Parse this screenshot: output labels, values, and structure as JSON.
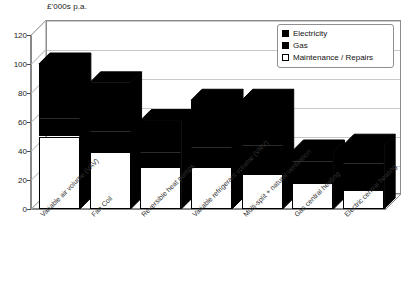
{
  "chart_data": {
    "type": "bar",
    "subtype": "stacked-3d-column",
    "title": "",
    "ylabel": "£'000s p.a.",
    "xlabel": "",
    "ylim": [
      0,
      120
    ],
    "yticks": [
      0,
      20,
      40,
      60,
      80,
      100,
      120
    ],
    "grid": true,
    "legend_position": "top-right",
    "categories": [
      "Variable air volume (VAV)",
      "Fan Coil",
      "Reversible heat pumps",
      "Variable refrigerant volume (VRV)",
      "Multi-split + natural ventilation",
      "Gas central heating",
      "Electric central heating"
    ],
    "series": [
      {
        "name": "Maintenance / Repairs",
        "color": "#ffffff",
        "values": [
          50,
          39,
          29,
          29,
          24,
          18,
          13
        ]
      },
      {
        "name": "Gas",
        "color": "#000000",
        "values": [
          13,
          15,
          10,
          14,
          20,
          15,
          19
        ]
      },
      {
        "name": "Electricity",
        "color": "#000000",
        "values": [
          37,
          33,
          22,
          32,
          31,
          7,
          12
        ]
      }
    ],
    "totals": [
      100,
      87,
      61,
      75,
      75,
      40,
      44
    ]
  },
  "legend": {
    "items": [
      {
        "label": "Electricity",
        "swatch": "filled-black-square"
      },
      {
        "label": "Gas",
        "swatch": "filled-black-square"
      },
      {
        "label": "Maintenance / Repairs",
        "swatch": "empty-white-square"
      }
    ]
  },
  "axis": {
    "y_title": "£'000s p.a.",
    "y_tick_labels": [
      "120",
      "100",
      "80",
      "60",
      "40",
      "20",
      "0"
    ]
  },
  "colors": {
    "electricity": "#000000",
    "gas": "#000000",
    "maintenance": "#ffffff",
    "axis": "#4a4a4a",
    "grid": "#c9c9c9",
    "frame": "#8c8c8c",
    "background": "#ffffff"
  }
}
